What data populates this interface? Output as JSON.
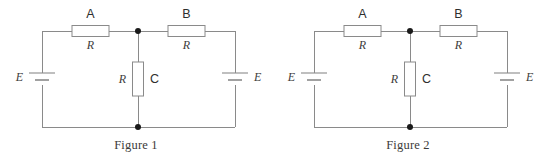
{
  "figures": [
    {
      "caption": "Figure 1",
      "components": {
        "resistor_a": {
          "name": "A",
          "value": "R"
        },
        "resistor_b": {
          "name": "B",
          "value": "R"
        },
        "resistor_c": {
          "name": "C",
          "value": "R"
        },
        "source_left": {
          "label": "E"
        },
        "source_right": {
          "label": "E"
        }
      }
    },
    {
      "caption": "Figure 2",
      "components": {
        "resistor_a": {
          "name": "A",
          "value": "R"
        },
        "resistor_b": {
          "name": "B",
          "value": "R"
        },
        "resistor_c": {
          "name": "C",
          "value": "R"
        },
        "source_left": {
          "label": "E"
        },
        "source_right": {
          "label": "E"
        }
      }
    }
  ],
  "style": {
    "wire_color": "#8a8a8a",
    "node_color": "#1a1a1a",
    "text_color": "#3d3d3d",
    "background": "#ffffff"
  }
}
